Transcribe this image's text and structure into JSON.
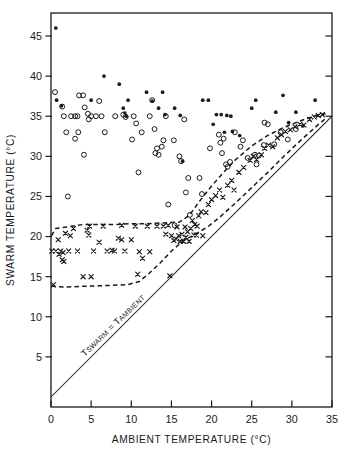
{
  "chart_data": {
    "type": "scatter",
    "title": "",
    "xlabel": "AMBIENT TEMPERATURE  (°C)",
    "ylabel": "SWARM TEMPERATURE (°C)",
    "xlim": [
      0,
      35
    ],
    "ylim": [
      0,
      47.5
    ],
    "xticks": [
      0,
      5,
      10,
      15,
      20,
      25,
      30,
      35
    ],
    "xtick_labels": [
      "0",
      "5",
      "10",
      "15",
      "20",
      "25",
      "30",
      "35"
    ],
    "yticks": [
      5,
      10,
      15,
      20,
      25,
      30,
      35,
      40,
      45
    ],
    "ytick_labels": [
      "5",
      "10",
      "15",
      "20",
      "25",
      "30",
      "35",
      "40",
      "45"
    ],
    "grid": false,
    "legend": "none",
    "marker_colors": {
      "open_circle": "#1a1a1a",
      "filled_circle": "#1a1a1a",
      "cross": "#1a1a1a",
      "identity_line": "#1a1a1a",
      "envelope": "#1a1a1a"
    },
    "annotations": [
      {
        "name": "identity-line-label",
        "text": "TSWARM = TAMBIENT",
        "parts": [
          "T",
          "SWARM",
          " = ",
          "T",
          "AMBIENT"
        ],
        "x": 4.2,
        "y": 5.0,
        "rotation": -44
      }
    ],
    "identity_line": {
      "label": "Tswarm = Tambient",
      "x": [
        0,
        35
      ],
      "y": [
        0,
        35
      ],
      "style": "solid"
    },
    "envelope_upper": {
      "style": "dashed",
      "points": [
        [
          0.05,
          20.1
        ],
        [
          0.6,
          21.0
        ],
        [
          2.0,
          21.2
        ],
        [
          4.0,
          21.5
        ],
        [
          6.0,
          21.5
        ],
        [
          8.0,
          21.5
        ],
        [
          10.0,
          21.6
        ],
        [
          12.0,
          21.6
        ],
        [
          14.0,
          21.7
        ],
        [
          16.0,
          21.8
        ],
        [
          17.2,
          22.6
        ],
        [
          18.5,
          24.4
        ],
        [
          20.0,
          26.3
        ],
        [
          21.5,
          28.0
        ],
        [
          23.0,
          29.6
        ],
        [
          25.0,
          31.3
        ],
        [
          27.0,
          32.6
        ],
        [
          29.0,
          33.6
        ],
        [
          31.0,
          34.4
        ],
        [
          33.0,
          35.1
        ],
        [
          34.2,
          35.3
        ]
      ]
    },
    "envelope_lower": {
      "style": "dashed",
      "points": [
        [
          0.05,
          13.8
        ],
        [
          1.5,
          13.7
        ],
        [
          4.0,
          13.8
        ],
        [
          7.0,
          13.9
        ],
        [
          9.5,
          14.0
        ],
        [
          11.0,
          14.4
        ],
        [
          12.2,
          15.4
        ],
        [
          13.5,
          16.6
        ],
        [
          15.0,
          18.2
        ],
        [
          16.5,
          19.5
        ],
        [
          18.0,
          20.3
        ],
        [
          19.5,
          21.2
        ],
        [
          21.0,
          22.4
        ],
        [
          23.0,
          24.2
        ],
        [
          25.0,
          26.1
        ],
        [
          27.0,
          28.0
        ],
        [
          29.0,
          30.0
        ],
        [
          31.0,
          31.9
        ],
        [
          33.0,
          33.7
        ],
        [
          34.3,
          34.8
        ]
      ]
    },
    "series": [
      {
        "name": "open_circle",
        "marker": "open-circle",
        "points": [
          [
            0.5,
            38.0
          ],
          [
            1.4,
            36.2
          ],
          [
            1.6,
            35.0
          ],
          [
            1.9,
            33.0
          ],
          [
            2.5,
            35.0
          ],
          [
            3.0,
            35.0
          ],
          [
            3.3,
            35.0
          ],
          [
            2.1,
            25.0
          ],
          [
            3.5,
            37.6
          ],
          [
            4.0,
            37.6
          ],
          [
            4.2,
            36.1
          ],
          [
            3.0,
            32.2
          ],
          [
            3.4,
            33.0
          ],
          [
            4.6,
            35.3
          ],
          [
            4.7,
            34.6
          ],
          [
            4.1,
            30.2
          ],
          [
            5.0,
            35.0
          ],
          [
            5.6,
            35.0
          ],
          [
            6.3,
            35.0
          ],
          [
            6.7,
            33.0
          ],
          [
            6.0,
            36.9
          ],
          [
            8.0,
            35.0
          ],
          [
            9.0,
            35.2
          ],
          [
            9.3,
            34.9
          ],
          [
            10.3,
            35.0
          ],
          [
            10.6,
            34.1
          ],
          [
            10.1,
            32.1
          ],
          [
            10.9,
            28.0
          ],
          [
            11.3,
            33.0
          ],
          [
            12.3,
            35.0
          ],
          [
            12.6,
            37.0
          ],
          [
            12.9,
            33.4
          ],
          [
            13.0,
            30.4
          ],
          [
            13.2,
            31.0
          ],
          [
            13.4,
            30.2
          ],
          [
            13.8,
            31.2
          ],
          [
            14.0,
            32.0
          ],
          [
            14.3,
            35.0
          ],
          [
            14.6,
            24.0
          ],
          [
            15.3,
            32.0
          ],
          [
            15.4,
            21.4
          ],
          [
            16.0,
            30.0
          ],
          [
            16.2,
            29.4
          ],
          [
            16.6,
            34.6
          ],
          [
            16.8,
            25.5
          ],
          [
            17.1,
            27.3
          ],
          [
            17.3,
            22.7
          ],
          [
            18.5,
            27.3
          ],
          [
            18.8,
            25.3
          ],
          [
            19.8,
            31.0
          ],
          [
            20.9,
            32.7
          ],
          [
            21.1,
            31.7
          ],
          [
            21.3,
            30.4
          ],
          [
            21.5,
            32.2
          ],
          [
            21.8,
            29.0
          ],
          [
            22.0,
            28.7
          ],
          [
            22.3,
            29.3
          ],
          [
            22.9,
            33.0
          ],
          [
            23.6,
            31.2
          ],
          [
            23.9,
            32.0
          ],
          [
            24.5,
            29.8
          ],
          [
            25.4,
            30.2
          ],
          [
            25.9,
            30.1
          ],
          [
            25.6,
            29.0
          ],
          [
            26.5,
            31.4
          ],
          [
            27.0,
            34.0
          ],
          [
            26.6,
            34.2
          ],
          [
            27.8,
            31.5
          ],
          [
            28.6,
            33.0
          ],
          [
            29.5,
            32.1
          ],
          [
            30.5,
            33.4
          ]
        ]
      },
      {
        "name": "filled_circle",
        "marker": "filled-circle",
        "points": [
          [
            0.6,
            46.0
          ],
          [
            0.7,
            37.0
          ],
          [
            1.3,
            36.3
          ],
          [
            5.0,
            37.0
          ],
          [
            6.6,
            40.0
          ],
          [
            8.5,
            39.0
          ],
          [
            9.0,
            36.0
          ],
          [
            9.2,
            35.4
          ],
          [
            9.4,
            35.0
          ],
          [
            9.6,
            37.0
          ],
          [
            11.9,
            38.0
          ],
          [
            12.6,
            36.9
          ],
          [
            13.4,
            36.0
          ],
          [
            13.9,
            38.0
          ],
          [
            14.2,
            35.2
          ],
          [
            15.4,
            36.0
          ],
          [
            16.1,
            35.1
          ],
          [
            16.4,
            29.4
          ],
          [
            18.9,
            37.0
          ],
          [
            19.6,
            37.0
          ],
          [
            20.2,
            34.0
          ],
          [
            20.6,
            35.2
          ],
          [
            21.2,
            35.2
          ],
          [
            21.6,
            33.0
          ],
          [
            21.9,
            35.1
          ],
          [
            22.4,
            35.0
          ],
          [
            22.6,
            33.1
          ],
          [
            23.5,
            32.6
          ],
          [
            25.0,
            36.0
          ],
          [
            25.5,
            37.0
          ],
          [
            28.0,
            35.5
          ],
          [
            28.9,
            37.6
          ],
          [
            29.6,
            34.2
          ],
          [
            30.5,
            35.5
          ],
          [
            31.4,
            33.8
          ],
          [
            32.9,
            37.0
          ]
        ]
      },
      {
        "name": "cross",
        "marker": "x-cross",
        "points": [
          [
            0.1,
            18.2
          ],
          [
            0.3,
            14.0
          ],
          [
            0.6,
            18.2
          ],
          [
            0.9,
            19.6
          ],
          [
            1.0,
            17.8
          ],
          [
            1.2,
            18.2
          ],
          [
            1.4,
            17.1
          ],
          [
            1.5,
            18.0
          ],
          [
            1.6,
            16.9
          ],
          [
            2.2,
            18.2
          ],
          [
            2.4,
            20.1
          ],
          [
            3.3,
            18.2
          ],
          [
            4.0,
            15.0
          ],
          [
            4.5,
            20.8
          ],
          [
            4.7,
            20.2
          ],
          [
            5.0,
            15.0
          ],
          [
            5.3,
            18.2
          ],
          [
            6.0,
            19.3
          ],
          [
            7.0,
            18.2
          ],
          [
            7.6,
            18.3
          ],
          [
            7.9,
            18.2
          ],
          [
            8.4,
            19.8
          ],
          [
            8.8,
            19.6
          ],
          [
            9.2,
            18.2
          ],
          [
            10.0,
            19.6
          ],
          [
            10.8,
            15.3
          ],
          [
            11.0,
            18.1
          ],
          [
            11.4,
            17.3
          ],
          [
            12.3,
            18.1
          ],
          [
            14.0,
            21.3
          ],
          [
            14.3,
            20.3
          ],
          [
            14.8,
            15.1
          ],
          [
            15.0,
            20.1
          ],
          [
            15.3,
            19.5
          ],
          [
            15.6,
            19.7
          ],
          [
            15.9,
            20.1
          ],
          [
            16.1,
            19.4
          ],
          [
            16.3,
            20.3
          ],
          [
            16.5,
            19.4
          ],
          [
            16.8,
            19.9
          ],
          [
            17.0,
            20.6
          ],
          [
            17.2,
            19.4
          ],
          [
            17.4,
            21.0
          ],
          [
            17.6,
            22.0
          ],
          [
            17.9,
            21.5
          ],
          [
            18.1,
            20.2
          ],
          [
            18.4,
            22.6
          ],
          [
            18.7,
            23.1
          ],
          [
            18.9,
            20.1
          ],
          [
            19.3,
            23.0
          ],
          [
            19.6,
            24.0
          ],
          [
            20.0,
            24.6
          ],
          [
            20.5,
            25.1
          ],
          [
            21.0,
            25.8
          ],
          [
            21.4,
            24.9
          ],
          [
            22.0,
            26.4
          ],
          [
            22.5,
            27.0
          ],
          [
            22.8,
            25.8
          ],
          [
            23.4,
            28.0
          ],
          [
            24.0,
            28.6
          ],
          [
            24.8,
            29.5
          ],
          [
            25.2,
            30.0
          ],
          [
            25.6,
            29.6
          ],
          [
            26.2,
            30.2
          ],
          [
            26.6,
            31.0
          ],
          [
            27.1,
            31.4
          ],
          [
            27.6,
            31.2
          ],
          [
            28.2,
            32.3
          ],
          [
            28.7,
            32.7
          ],
          [
            29.2,
            33.1
          ],
          [
            29.8,
            33.3
          ],
          [
            30.4,
            33.7
          ],
          [
            31.0,
            34.0
          ],
          [
            31.5,
            33.9
          ],
          [
            32.2,
            34.6
          ],
          [
            32.8,
            34.9
          ],
          [
            33.3,
            35.1
          ],
          [
            33.8,
            35.2
          ],
          [
            17.8,
            20.2
          ],
          [
            18.2,
            21.3
          ],
          [
            16.7,
            21.2
          ],
          [
            15.7,
            21.2
          ],
          [
            14.6,
            21.4
          ],
          [
            13.2,
            21.3
          ],
          [
            12.0,
            21.3
          ],
          [
            10.5,
            21.3
          ],
          [
            8.8,
            21.4
          ],
          [
            6.5,
            21.3
          ],
          [
            4.8,
            21.3
          ],
          [
            2.8,
            21.0
          ],
          [
            1.8,
            20.4
          ]
        ]
      }
    ]
  }
}
